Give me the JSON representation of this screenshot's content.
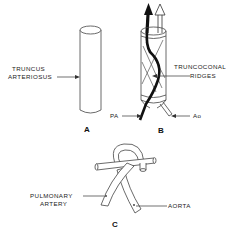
{
  "figure": {
    "panels": [
      {
        "id": "A",
        "label": "A",
        "annotations": [
          {
            "line1": "TRUNCUS",
            "line2": "ARTERIOSUS"
          }
        ]
      },
      {
        "id": "B",
        "label": "B",
        "annotations": [
          {
            "line1": "TRUNCOCONAL",
            "line2": "RIDGES"
          },
          {
            "text": "PA"
          },
          {
            "text": "Ao"
          }
        ]
      },
      {
        "id": "C",
        "label": "C",
        "annotations": [
          {
            "line1": "PULMONARY",
            "line2": "ARTERY"
          },
          {
            "text": "AORTA"
          }
        ]
      }
    ],
    "colors": {
      "stroke": "#333333",
      "background": "#ffffff",
      "dark_flow": "#111111"
    }
  }
}
